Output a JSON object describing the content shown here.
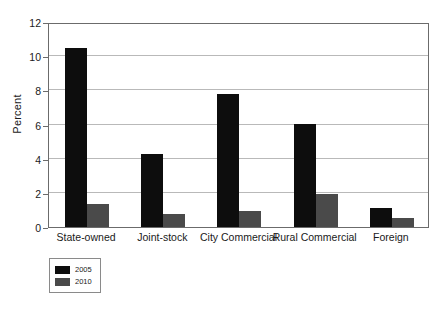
{
  "chart_data": {
    "type": "bar",
    "title": "",
    "xlabel": "",
    "ylabel": "Percent",
    "categories": [
      "State-owned",
      "Joint-stock",
      "City Commercial",
      "Rural Commercial",
      "Foreign"
    ],
    "series": [
      {
        "name": "2005",
        "color": "#0d0d0d",
        "values": [
          10.5,
          4.25,
          7.8,
          6.05,
          1.1
        ]
      },
      {
        "name": "2010",
        "color": "#4a4a4a",
        "values": [
          1.35,
          0.75,
          0.95,
          1.95,
          0.55
        ]
      }
    ],
    "ylim": [
      0,
      12
    ],
    "yticks": [
      0,
      2,
      4,
      6,
      8,
      10,
      12
    ],
    "ytick_labels": [
      "0",
      "2",
      "4",
      "6",
      "8",
      "10",
      "12"
    ],
    "grid": "horizontal",
    "legend_position": "below-left",
    "legend_entries": [
      "2005",
      "2010"
    ]
  }
}
